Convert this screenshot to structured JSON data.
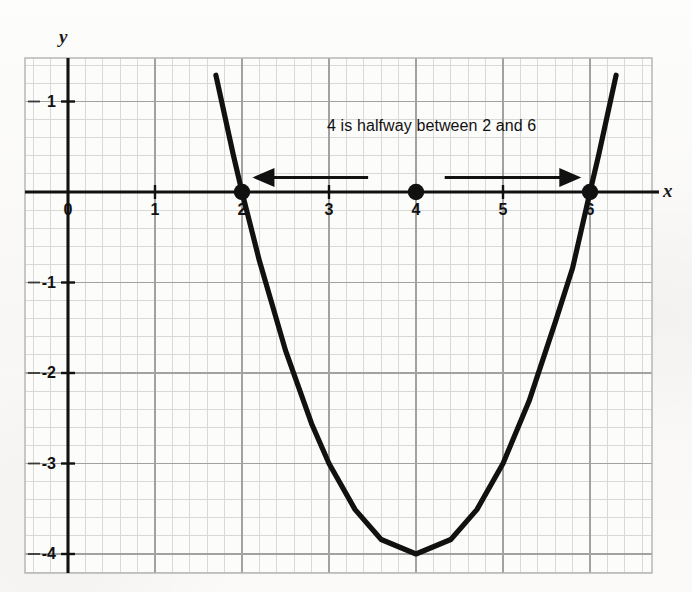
{
  "figure": {
    "kind": "coordinate-grid-graph",
    "background_color": "#fbfbfa",
    "frame_color": "#b9b9b9",
    "grid_minor_color": "#d8d8d6",
    "grid_major_color": "#9a9a98",
    "axis_color": "#111111",
    "curve_color": "#111111",
    "point_color": "#111111"
  },
  "axes": {
    "x_axis_label": "x",
    "y_axis_label": "y",
    "x_ticks": [
      {
        "value": 0,
        "label": "0"
      },
      {
        "value": 1,
        "label": "1"
      },
      {
        "value": 2,
        "label": "2"
      },
      {
        "value": 3,
        "label": "3"
      },
      {
        "value": 4,
        "label": "4"
      },
      {
        "value": 5,
        "label": "5"
      },
      {
        "value": 6,
        "label": "6"
      }
    ],
    "y_ticks": [
      {
        "value": 1,
        "label": "1"
      },
      {
        "value": -1,
        "label": "-1"
      },
      {
        "value": -2,
        "label": "-2"
      },
      {
        "value": -3,
        "label": "-3"
      },
      {
        "value": -4,
        "label": "-4"
      }
    ]
  },
  "annotation": {
    "text": "4 is halfway between 2 and 6"
  },
  "chart_data": {
    "type": "line",
    "title": "",
    "subtitle": "",
    "xlabel": "x",
    "ylabel": "y",
    "xlim": [
      -0.5,
      6.75
    ],
    "ylim": [
      -4.7,
      1.5
    ],
    "grid": true,
    "grid_minor_step": 0.2,
    "grid_major_step": 1,
    "legend": "none",
    "series": [
      {
        "name": "y = (x - 2)(x - 6)",
        "equation": "y = x^2 - 8x + 12",
        "type": "parabola",
        "vertex": [
          4,
          -4
        ],
        "roots": [
          2,
          6
        ],
        "x": [
          1.7,
          1.9,
          2.0,
          2.2,
          2.5,
          2.8,
          3.0,
          3.3,
          3.6,
          4.0,
          4.4,
          4.7,
          5.0,
          5.3,
          5.6,
          5.8,
          6.0,
          6.1,
          6.3
        ],
        "y": [
          1.29,
          0.41,
          0.0,
          -0.76,
          -1.75,
          -2.56,
          -3.0,
          -3.51,
          -3.84,
          -4.0,
          -3.84,
          -3.51,
          -3.0,
          -2.31,
          -1.44,
          -0.84,
          0.0,
          0.41,
          1.29
        ]
      }
    ],
    "points": [
      {
        "label": "",
        "x": 2,
        "y": 0,
        "marker": "filled-circle",
        "note": "root"
      },
      {
        "label": "",
        "x": 4,
        "y": 0,
        "marker": "filled-circle",
        "note": "axis of symmetry / midpoint"
      },
      {
        "label": "",
        "x": 6,
        "y": 0,
        "marker": "filled-circle",
        "note": "root"
      }
    ],
    "annotations": [
      {
        "kind": "text",
        "text": "4 is halfway between 2 and 6",
        "x": 4.18,
        "y": 0.72
      },
      {
        "kind": "arrow",
        "direction": "left",
        "from_x": 3.45,
        "to_x": 2.12,
        "y": 0.16
      },
      {
        "kind": "arrow",
        "direction": "right",
        "from_x": 4.33,
        "to_x": 5.9,
        "y": 0.16
      }
    ]
  }
}
